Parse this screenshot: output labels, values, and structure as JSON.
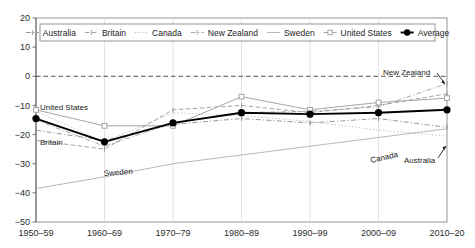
{
  "chart_data": {
    "type": "line",
    "title": "",
    "subtitle": "",
    "xlabel": "",
    "ylabel": "",
    "categories": [
      "1950–59",
      "1960–69",
      "1970–79",
      "1980–89",
      "1990–99",
      "2000–09",
      "2010–20"
    ],
    "ytick_labels": [
      "20",
      "10",
      "0",
      "−10",
      "−20",
      "−30",
      "−40",
      "−50"
    ],
    "ytick_values": [
      20,
      10,
      0,
      -10,
      -20,
      -30,
      -40,
      -50
    ],
    "ylim": [
      -50,
      20
    ],
    "grid": true,
    "zero_reference_line": 0,
    "legend_position": "top",
    "series": [
      {
        "name": "Australia",
        "style": "dash-dot-marker",
        "color": "#8d8d8d",
        "values": [
          -18.5,
          -22.0,
          -16.5,
          -14.5,
          -16.0,
          -14.5,
          -17.5
        ]
      },
      {
        "name": "Britain",
        "style": "dashed-marker",
        "color": "#9a9a9a",
        "values": [
          -22.0,
          -25.0,
          -11.5,
          -10.0,
          -12.5,
          -10.0,
          -6.0
        ]
      },
      {
        "name": "Canada",
        "style": "dotted",
        "color": "#b5b5b5",
        "values": [
          -12.0,
          -22.5,
          -12.5,
          -13.5,
          -15.5,
          -18.5,
          -20.5
        ]
      },
      {
        "name": "New Zealand",
        "style": "dash-dot",
        "color": "#a0a0a0",
        "values": [
          -15.0,
          -24.0,
          -16.0,
          -12.5,
          -12.0,
          -10.5,
          -2.5
        ]
      },
      {
        "name": "Sweden",
        "style": "solid-thin",
        "color": "#b0b0b0",
        "values": [
          -38.5,
          -34.5,
          -30.0,
          -27.0,
          -24.0,
          -21.0,
          -18.0
        ]
      },
      {
        "name": "United States",
        "style": "solid-open",
        "color": "#9b9b9b",
        "values": [
          -11.5,
          -17.0,
          -17.0,
          -7.0,
          -11.5,
          -9.0,
          -7.5
        ]
      },
      {
        "name": "Average",
        "style": "solid-filled",
        "color": "#000000",
        "values": [
          -14.5,
          -22.5,
          -16.0,
          -12.5,
          -13.0,
          -12.5,
          -11.5
        ]
      }
    ],
    "annotations": [
      {
        "text": "United States",
        "x": 40,
        "y": 110,
        "rotate": 0,
        "arrow": false
      },
      {
        "text": "Britain",
        "x": 40,
        "y": 145,
        "rotate": 0,
        "arrow": false
      },
      {
        "text": "Sweden",
        "x": 104,
        "y": 176,
        "rotate": -4,
        "arrow": false
      },
      {
        "text": "New Zealand",
        "x": 383,
        "y": 75,
        "rotate": 0,
        "arrow": true
      },
      {
        "text": "Canada",
        "x": 371,
        "y": 163,
        "rotate": -13,
        "arrow": false
      },
      {
        "text": "Australia",
        "x": 404,
        "y": 163,
        "rotate": 0,
        "arrow": true
      }
    ]
  }
}
